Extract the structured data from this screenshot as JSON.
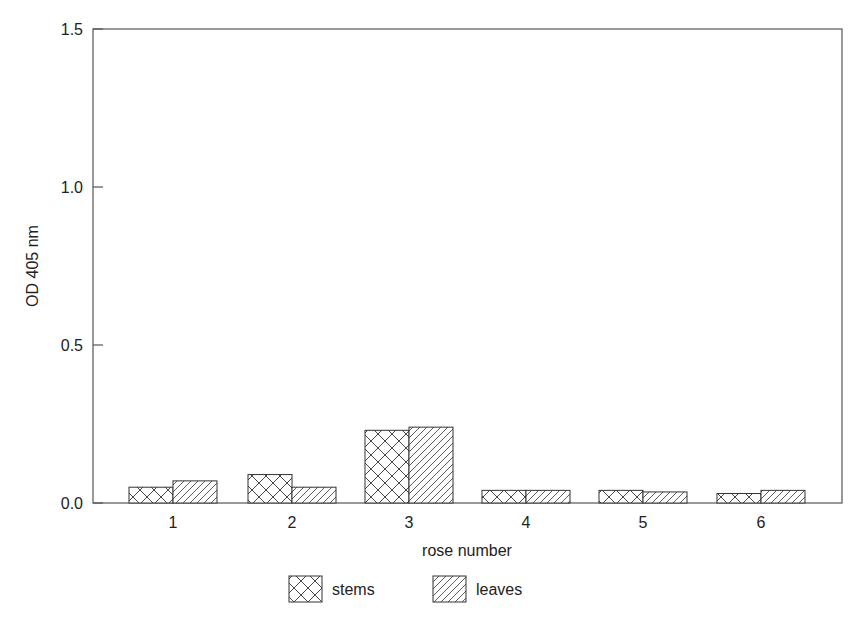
{
  "chart_data": {
    "type": "bar",
    "title": "",
    "xlabel": "rose number",
    "ylabel": "OD 405 nm",
    "ylim": [
      0,
      1.5
    ],
    "yticks": [
      "0.0",
      "0.5",
      "1.0",
      "1.5"
    ],
    "categories": [
      "1",
      "2",
      "3",
      "4",
      "5",
      "6"
    ],
    "series": [
      {
        "name": "stems",
        "pattern": "crosshatch",
        "values": [
          0.05,
          0.09,
          0.23,
          0.04,
          0.04,
          0.03
        ]
      },
      {
        "name": "leaves",
        "pattern": "diagonal",
        "values": [
          0.07,
          0.05,
          0.24,
          0.04,
          0.035,
          0.04
        ]
      }
    ],
    "grid": false,
    "legend_position": "bottom"
  }
}
